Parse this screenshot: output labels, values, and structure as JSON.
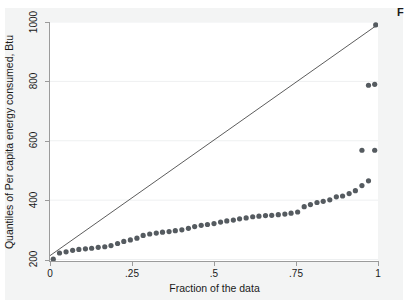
{
  "figure": {
    "corner_note": "F",
    "background_color": "#f3f4f4",
    "plot_background_color": "#ffffff"
  },
  "chart_data": {
    "type": "scatter",
    "title": "",
    "subtitle": "",
    "xlabel": "Fraction of the data",
    "ylabel": "Quantiles of Per capita energy consumed, Btu",
    "xlim": [
      0,
      1
    ],
    "ylim": [
      195,
      1000
    ],
    "grid": true,
    "grid_axis": "y",
    "grid_color": "#eef0f1",
    "legend": "none",
    "xticks": [
      0,
      0.25,
      0.5,
      0.75,
      1
    ],
    "xtick_labels": [
      "0",
      ".25",
      ".5",
      ".75",
      "1"
    ],
    "yticks": [
      200,
      400,
      600,
      800,
      1000
    ],
    "ytick_labels": [
      "200",
      "400",
      "600",
      "800",
      "1000"
    ],
    "marker_color": "#555b60",
    "marker_size": 2.6,
    "line_color": "#4a4a4a",
    "series": [
      {
        "name": "Quantiles",
        "type": "scatter",
        "x": [
          0.01,
          0.029,
          0.049,
          0.069,
          0.088,
          0.108,
          0.127,
          0.147,
          0.167,
          0.186,
          0.206,
          0.225,
          0.245,
          0.265,
          0.284,
          0.304,
          0.324,
          0.343,
          0.363,
          0.382,
          0.402,
          0.422,
          0.441,
          0.461,
          0.48,
          0.5,
          0.52,
          0.539,
          0.559,
          0.578,
          0.598,
          0.618,
          0.637,
          0.657,
          0.676,
          0.696,
          0.716,
          0.735,
          0.755,
          0.775,
          0.794,
          0.814,
          0.833,
          0.853,
          0.873,
          0.892,
          0.912,
          0.931,
          0.951,
          0.971,
          0.99
        ],
        "y": [
          201,
          222,
          226,
          231,
          234,
          236,
          238,
          241,
          243,
          247,
          254,
          261,
          266,
          272,
          281,
          286,
          289,
          292,
          294,
          297,
          300,
          305,
          311,
          315,
          318,
          321,
          326,
          330,
          333,
          337,
          340,
          344,
          346,
          348,
          349,
          351,
          353,
          356,
          360,
          378,
          385,
          392,
          396,
          401,
          411,
          414,
          422,
          432,
          449,
          465,
          568
        ]
      },
      {
        "name": "Outliers",
        "type": "scatter",
        "x": [
          0.951,
          0.971,
          0.99
        ],
        "y": [
          568,
          787,
          790
        ]
      },
      {
        "name": "Reference line",
        "type": "line",
        "x": [
          0.0,
          1.0
        ],
        "y": [
          213,
          992
        ]
      },
      {
        "name": "Top point",
        "type": "scatter",
        "x": [
          0.993
        ],
        "y": [
          990
        ]
      }
    ]
  }
}
